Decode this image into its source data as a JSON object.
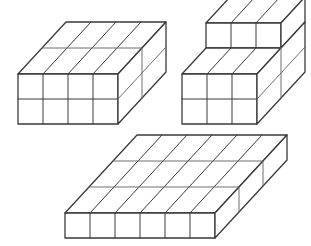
{
  "page": {
    "background_color": "#ffffff",
    "width": 311,
    "height": 246
  },
  "style": {
    "edge_color": "#3a3a3a",
    "edge_color_light": "#6e6e6e",
    "face_color": "#ffffff",
    "outline_width": 1.3,
    "inner_width": 1.0
  },
  "chart_data": {
    "type": "diagram",
    "projection": "oblique-isometric",
    "unit_cube_px": 25,
    "depth_offset_px": {
      "dx": 24,
      "dy": -26
    },
    "figures": [
      {
        "id": "figure-1",
        "label": "Figure 1",
        "shape": "rectangular-prism",
        "dimensions": {
          "width": 4,
          "height": 2,
          "depth": 2
        },
        "cube_count": 16,
        "origin_px": {
          "x": 18,
          "y": 124
        }
      },
      {
        "id": "figure-2",
        "label": "Figure 2",
        "shape": "stepped-prism",
        "dimensions": {
          "width": 3,
          "height": 2,
          "depth": 2
        },
        "step": {
          "width": 3,
          "height": 1,
          "depth": 1,
          "position": "back-top"
        },
        "cube_count": 15,
        "origin_px": {
          "x": 182,
          "y": 124
        }
      },
      {
        "id": "figure-3",
        "label": "Figure 3",
        "shape": "rectangular-prism",
        "dimensions": {
          "width": 6,
          "height": 1,
          "depth": 3
        },
        "cube_count": 18,
        "origin_px": {
          "x": 65,
          "y": 238
        }
      }
    ]
  }
}
